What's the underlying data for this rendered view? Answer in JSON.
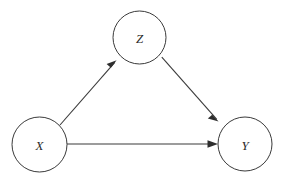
{
  "figure": {
    "kind": "causal-dag",
    "background_color": "#ffffff",
    "stroke_color": "#3a3a3a",
    "label_color": "#2b2b2b",
    "arrow_fill": "#2e2e2e",
    "width": 282,
    "height": 183
  },
  "nodes": [
    {
      "id": "X",
      "label": "X",
      "name": "node-x",
      "cx": 39.5,
      "cy": 144.5,
      "r": 27.5
    },
    {
      "id": "Z",
      "label": "Z",
      "name": "node-z",
      "cx": 139.5,
      "cy": 37.5,
      "r": 26.5
    },
    {
      "id": "Y",
      "label": "Y",
      "name": "node-y",
      "cx": 245,
      "cy": 144,
      "r": 27
    }
  ],
  "edges": [
    {
      "id": "x-to-z",
      "name": "edge-x-to-z",
      "from": "X",
      "to": "Z",
      "label": "",
      "x1": 60,
      "y1": 125,
      "x2": 116,
      "y2": 61,
      "arrowhead": true
    },
    {
      "id": "z-to-y",
      "name": "edge-z-to-y",
      "from": "Z",
      "to": "Y",
      "label": "",
      "x1": 162,
      "y1": 57,
      "x2": 218.5,
      "y2": 121,
      "arrowhead": true
    },
    {
      "id": "x-to-y",
      "name": "edge-x-to-y",
      "from": "X",
      "to": "Y",
      "label": "",
      "x1": 67,
      "y1": 144,
      "x2": 218,
      "y2": 144,
      "arrowhead": true
    }
  ]
}
